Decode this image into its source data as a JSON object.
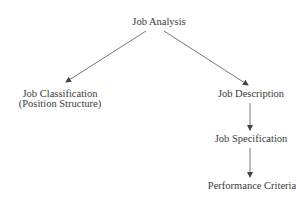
{
  "diagram": {
    "type": "flowchart",
    "nodes": {
      "root": "Job Analysis",
      "left": {
        "line1": "Job Classification",
        "line2": "(Position Structure)"
      },
      "right1": "Job Description",
      "right2": "Job Specification",
      "right3": "Performance Criteria"
    },
    "edges": [
      [
        "Job Analysis",
        "Job Classification (Position Structure)"
      ],
      [
        "Job Analysis",
        "Job Description"
      ],
      [
        "Job Description",
        "Job Specification"
      ],
      [
        "Job Specification",
        "Performance Criteria"
      ]
    ],
    "colors": {
      "text": "#3a3a3a",
      "line": "#555555",
      "background": "#ffffff"
    }
  }
}
